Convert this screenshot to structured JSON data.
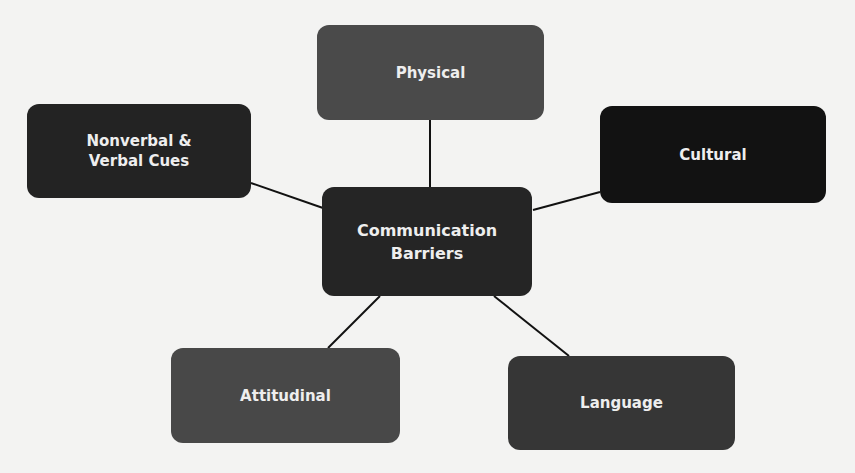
{
  "diagram": {
    "center": {
      "label": "Communication\nBarriers",
      "color": "#252525"
    },
    "nodes": [
      {
        "id": "physical",
        "label": "Physical",
        "color": "#4a4a4a"
      },
      {
        "id": "nonverbal",
        "label": "Nonverbal &\nVerbal Cues",
        "color": "#232323"
      },
      {
        "id": "cultural",
        "label": "Cultural",
        "color": "#121212"
      },
      {
        "id": "attitudinal",
        "label": "Attitudinal",
        "color": "#484848"
      },
      {
        "id": "language",
        "label": "Language",
        "color": "#363636"
      }
    ],
    "edges": [
      [
        "center",
        "physical"
      ],
      [
        "center",
        "nonverbal"
      ],
      [
        "center",
        "cultural"
      ],
      [
        "center",
        "attitudinal"
      ],
      [
        "center",
        "language"
      ]
    ]
  }
}
